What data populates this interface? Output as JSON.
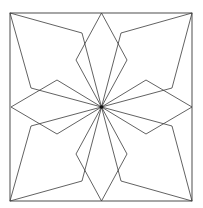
{
  "diagram": {
    "stroke_color": "#3a3a3a",
    "center_dot_color": "#111111",
    "background": "#ffffff",
    "frame": {
      "x": 10,
      "y": 13,
      "width": 182,
      "height": 188
    },
    "center": [
      101.5,
      107
    ],
    "kites": [
      {
        "name": "top-left",
        "points": [
          [
            10,
            13
          ],
          [
            82,
            33
          ],
          [
            101.5,
            107
          ],
          [
            31,
            88
          ]
        ]
      },
      {
        "name": "top-right",
        "points": [
          [
            192,
            13
          ],
          [
            121,
            33
          ],
          [
            101.5,
            107
          ],
          [
            172,
            88
          ]
        ]
      },
      {
        "name": "bottom-left",
        "points": [
          [
            10,
            201
          ],
          [
            82,
            181
          ],
          [
            101.5,
            107
          ],
          [
            31,
            126
          ]
        ]
      },
      {
        "name": "bottom-right",
        "points": [
          [
            192,
            201
          ],
          [
            121,
            181
          ],
          [
            101.5,
            107
          ],
          [
            172,
            126
          ]
        ]
      }
    ],
    "diamonds": [
      {
        "name": "top",
        "points": [
          [
            101.5,
            13
          ],
          [
            127,
            60
          ],
          [
            101.5,
            107
          ],
          [
            76,
            60
          ]
        ]
      },
      {
        "name": "bottom",
        "points": [
          [
            101.5,
            201
          ],
          [
            127,
            154
          ],
          [
            101.5,
            107
          ],
          [
            76,
            154
          ]
        ]
      },
      {
        "name": "left",
        "points": [
          [
            11,
            107
          ],
          [
            57,
            80
          ],
          [
            101.5,
            107
          ],
          [
            57,
            134
          ]
        ]
      },
      {
        "name": "right",
        "points": [
          [
            192,
            107
          ],
          [
            146,
            80
          ],
          [
            101.5,
            107
          ],
          [
            146,
            134
          ]
        ]
      }
    ]
  }
}
